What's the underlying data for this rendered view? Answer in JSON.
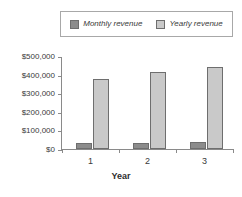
{
  "chart_data": {
    "type": "bar",
    "title": "",
    "subtitle": "",
    "xlabel": "Year",
    "ylabel": "",
    "categories": [
      "1",
      "2",
      "3"
    ],
    "series": [
      {
        "name": "Monthly revenue",
        "values": [
          30000,
          33000,
          37000
        ],
        "color": "#8c8c8c"
      },
      {
        "name": "Yearly revenue",
        "values": [
          378000,
          412000,
          443000
        ],
        "color": "#c9c9c9"
      }
    ],
    "ylim": [
      0,
      500000
    ],
    "ytick_values": [
      500000,
      400000,
      300000,
      200000,
      100000,
      0
    ],
    "ytick_labels": [
      "$500,000",
      "$400,000",
      "$300,000",
      "$200,000",
      "$100,000",
      "$0"
    ],
    "grid": false,
    "legend_position": "top"
  },
  "legend": {
    "entries": [
      {
        "label": "Monthly revenue",
        "swatch": "legend-swatch-monthly"
      },
      {
        "label": "Yearly revenue",
        "swatch": "legend-swatch-yearly"
      }
    ]
  },
  "axes": {
    "x_title": "Year",
    "x_tick_labels": [
      "1",
      "2",
      "3"
    ],
    "y_tick_labels": [
      "$500,000",
      "$400,000",
      "$300,000",
      "$200,000",
      "$100,000",
      "$0"
    ]
  }
}
